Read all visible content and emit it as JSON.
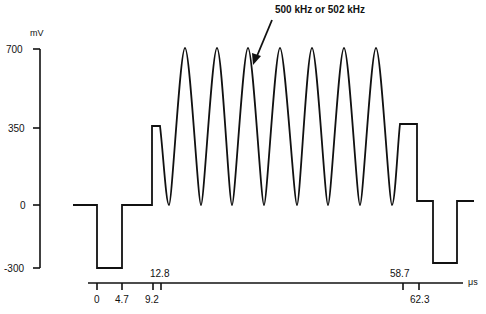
{
  "diagram": {
    "annotation": "500 kHz or 502 kHz",
    "y_axis": {
      "unit": "mV",
      "ticks": [
        {
          "label": "700",
          "value": 700
        },
        {
          "label": "350",
          "value": 350
        },
        {
          "label": "0",
          "value": 0
        },
        {
          "label": "-300",
          "value": -300
        }
      ]
    },
    "time_axis": {
      "unit": "μs",
      "ticks_below": [
        {
          "label": "0",
          "value": 0
        },
        {
          "label": "4.7",
          "value": 4.7
        },
        {
          "label": "9.2",
          "value": 9.2
        },
        {
          "label": "62.3",
          "value": 62.3
        }
      ],
      "ticks_above": [
        {
          "label": "12.8",
          "value": 12.8
        },
        {
          "label": "58.7",
          "value": 58.7
        }
      ]
    },
    "waveform": {
      "segments": [
        {
          "type": "level",
          "mV": 0,
          "from_us": null,
          "to_us": 0
        },
        {
          "type": "level",
          "mV": -300,
          "from_us": 0,
          "to_us": 4.7
        },
        {
          "type": "level",
          "mV": 0,
          "from_us": 4.7,
          "to_us": 9.2
        },
        {
          "type": "level",
          "mV": 350,
          "from_us": 9.2,
          "to_us": 12.8
        },
        {
          "type": "sine",
          "min_mV": 0,
          "max_mV": 700,
          "freq": "500 kHz or 502 kHz",
          "peaks": 7,
          "from_us": 12.8,
          "to_us": 58.7
        },
        {
          "type": "level",
          "mV": 350,
          "from_us": 58.7,
          "to_us": 62.3
        },
        {
          "type": "level",
          "mV": 0,
          "after_us": 62.3
        },
        {
          "type": "level",
          "mV": -300
        },
        {
          "type": "level",
          "mV": 0
        }
      ]
    }
  }
}
